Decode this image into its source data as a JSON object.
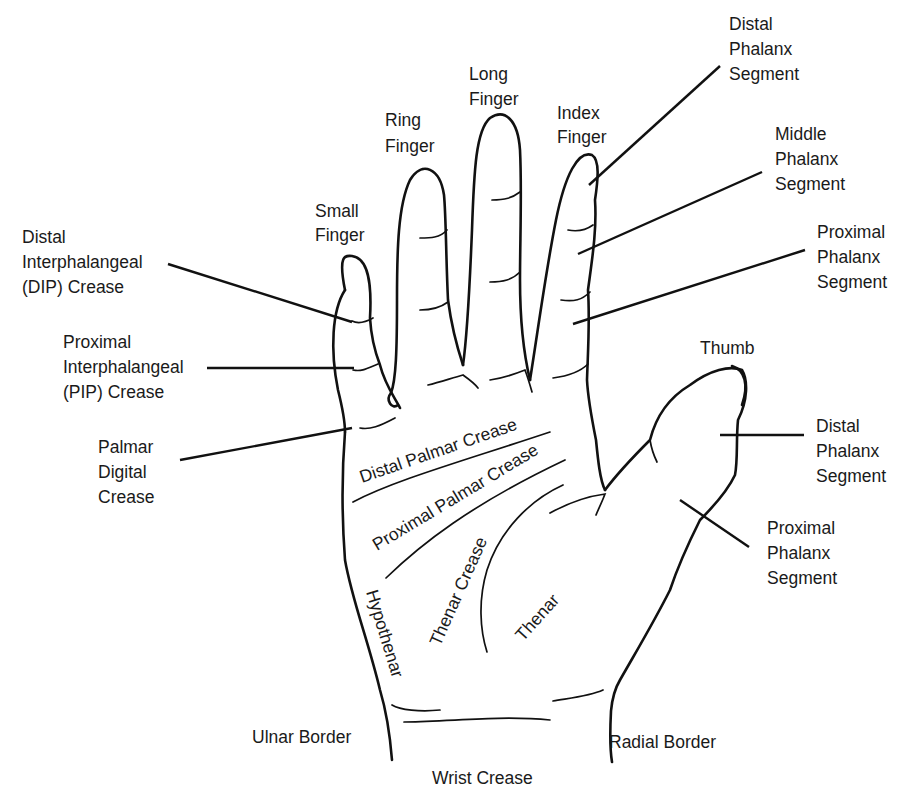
{
  "figure": {
    "colors": {
      "background": "#ffffff",
      "ink": "#111111"
    }
  },
  "labels": {
    "small_finger": [
      "Small",
      "Finger"
    ],
    "ring_finger": [
      "Ring",
      "Finger"
    ],
    "long_finger": [
      "Long",
      "Finger"
    ],
    "index_finger": [
      "Index",
      "Finger"
    ],
    "thumb": "Thumb",
    "dip_crease": [
      "Distal",
      "Interphalangeal",
      "(DIP) Crease"
    ],
    "pip_crease": [
      "Proximal",
      "Interphalangeal",
      "(PIP) Crease"
    ],
    "palmar_digital_crease": [
      "Palmar",
      "Digital",
      "Crease"
    ],
    "finger_distal_phalanx": [
      "Distal",
      "Phalanx",
      "Segment"
    ],
    "finger_middle_phalanx": [
      "Middle",
      "Phalanx",
      "Segment"
    ],
    "finger_proximal_phalanx": [
      "Proximal",
      "Phalanx",
      "Segment"
    ],
    "thumb_distal_phalanx": [
      "Distal",
      "Phalanx",
      "Segment"
    ],
    "thumb_proximal_phalanx": [
      "Proximal",
      "Phalanx",
      "Segment"
    ],
    "distal_palmar_crease": "Distal Palmar Crease",
    "proximal_palmar_crease": "Proximal Palmar Crease",
    "thenar_crease": "Thenar Crease",
    "thenar": "Thenar",
    "hypothenar": "Hypothenar",
    "ulnar_border": "Ulnar Border",
    "radial_border": "Radial Border",
    "wrist_crease": "Wrist Crease"
  }
}
